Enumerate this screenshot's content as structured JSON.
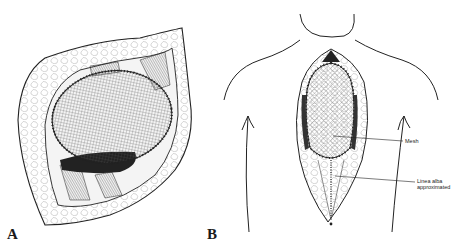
{
  "figure": {
    "panels": [
      {
        "id": "A",
        "label": "A",
        "description": "Close-up of chest wall defect with oval mesh sutured around margins, exposed ribs and subcutaneous tissue"
      },
      {
        "id": "B",
        "label": "B",
        "description": "Anterior torso outline showing midline incision with mesh placed and linea alba approximated below"
      }
    ],
    "annotations": [
      {
        "text": "Mesh",
        "target": "mesh"
      },
      {
        "line1": "Linea alba",
        "line2": "approximated",
        "target": "linea-alba"
      }
    ],
    "colors": {
      "ink": "#1a1a1a",
      "background": "#ffffff",
      "mesh": "#555555"
    }
  }
}
